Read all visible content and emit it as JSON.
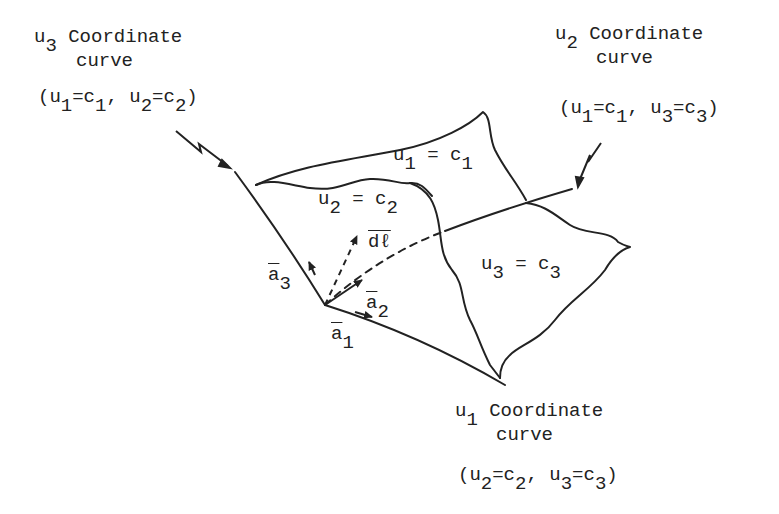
{
  "diagram": {
    "labels": {
      "u3_curve": {
        "var": "u",
        "sub": "3",
        "line1": "Coordinate",
        "line2": "curve",
        "cond": [
          "(u",
          "1",
          "=c",
          "1",
          ", u",
          "2",
          "=c",
          "2",
          ")"
        ]
      },
      "u2_curve": {
        "var": "u",
        "sub": "2",
        "line1": "Coordinate",
        "line2": "curve",
        "cond": [
          "(u",
          "1",
          "=c",
          "1",
          ", u",
          "3",
          "=c",
          "3",
          ")"
        ]
      },
      "u1_curve": {
        "var": "u",
        "sub": "1",
        "line1": "Coordinate",
        "line2": "curve",
        "cond": [
          "(u",
          "2",
          "=c",
          "2",
          ", u",
          "3",
          "=c",
          "3",
          ")"
        ]
      },
      "surface_u1": {
        "lhs": "u",
        "sub": "1",
        "eq": " = c",
        "rsub": "1"
      },
      "surface_u2": {
        "lhs": "u",
        "sub": "2",
        "eq": " = c",
        "rsub": "2"
      },
      "surface_u3": {
        "lhs": "u",
        "sub": "3",
        "eq": " = c",
        "rsub": "3"
      },
      "vec_a1": {
        "base": "a",
        "sub": "1"
      },
      "vec_a2": {
        "base": "a",
        "sub": "2"
      },
      "vec_a3": {
        "base": "a",
        "sub": "3"
      },
      "vec_dl": {
        "base": "dℓ"
      }
    },
    "colors": {
      "ink": "#222222",
      "background": "#ffffff"
    }
  }
}
